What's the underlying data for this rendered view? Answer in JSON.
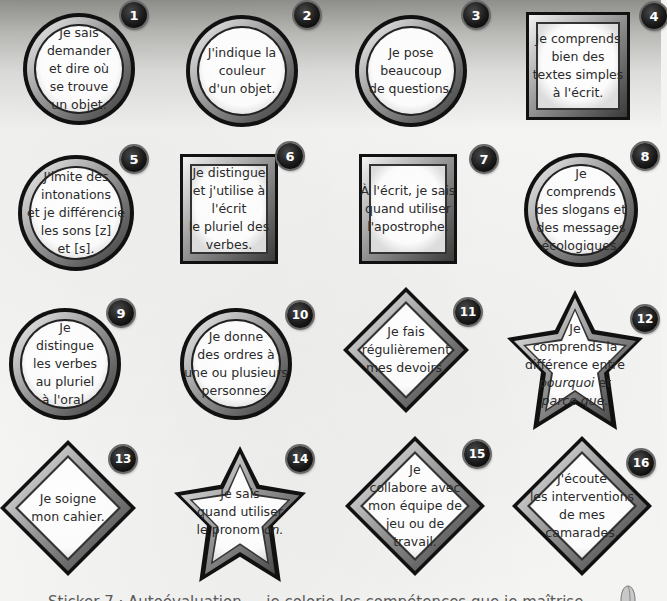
{
  "page": {
    "background": {
      "top_gradient": "#8e8e8b",
      "base": "#f4f4f3"
    },
    "colors": {
      "frame_dark": "#1a1a1a",
      "frame_mid": "#8a8a8a",
      "frame_light": "#ffffff",
      "text": "#2a2a2a",
      "badge": "#1a1a1a"
    }
  },
  "cards": [
    {
      "number": "1",
      "shape": "circle",
      "lines": [
        "Je sais",
        "demander",
        "et dire où",
        "se trouve",
        "un objet."
      ]
    },
    {
      "number": "2",
      "shape": "circle",
      "lines": [
        "J'indique la",
        "couleur",
        "d'un objet."
      ]
    },
    {
      "number": "3",
      "shape": "circle",
      "lines": [
        "Je pose",
        "beaucoup",
        "de questions."
      ]
    },
    {
      "number": "4",
      "shape": "square",
      "lines": [
        "Je comprends",
        "bien des",
        "textes simples",
        "à l'écrit."
      ]
    },
    {
      "number": "5",
      "shape": "circle",
      "lines": [
        "J'imite des",
        "intonations",
        "et je différencie",
        "les sons [z]",
        "et [s]."
      ]
    },
    {
      "number": "6",
      "shape": "square",
      "lines": [
        "Je distingue",
        "et j'utilise à",
        "l'écrit",
        "le pluriel des",
        "verbes."
      ]
    },
    {
      "number": "7",
      "shape": "square",
      "lines": [
        "À l'écrit, je sais",
        "quand utiliser",
        "l'apostrophe."
      ]
    },
    {
      "number": "8",
      "shape": "circle",
      "lines": [
        "Je",
        "comprends",
        "des slogans et",
        "des messages",
        "écologiques."
      ]
    },
    {
      "number": "9",
      "shape": "circle",
      "lines": [
        "Je",
        "distingue",
        "les verbes",
        "au pluriel",
        "à l'oral."
      ]
    },
    {
      "number": "10",
      "shape": "circle",
      "lines": [
        "Je donne",
        "des ordres à",
        "une ou plusieurs",
        "personnes."
      ]
    },
    {
      "number": "11",
      "shape": "diamond",
      "lines": [
        "Je fais",
        "régulièrement",
        "mes devoirs."
      ]
    },
    {
      "number": "12",
      "shape": "star",
      "lines": [
        "Je",
        "comprends la",
        "différence entre"
      ],
      "italic_lines": [
        {
          "italic": "pourquoi",
          "rest": " et"
        },
        {
          "italic": "parce que.",
          "rest": ""
        }
      ]
    },
    {
      "number": "13",
      "shape": "diamond",
      "lines": [
        "Je soigne",
        "mon cahier."
      ]
    },
    {
      "number": "14",
      "shape": "star",
      "lines": [
        "Je sais",
        "quand utiliser"
      ],
      "italic_lines": [
        {
          "prefix": "le pronom ",
          "italic": "on."
        }
      ]
    },
    {
      "number": "15",
      "shape": "diamond",
      "lines": [
        "Je",
        "collabore avec",
        "mon équipe de",
        "jeu ou de",
        "travail."
      ]
    },
    {
      "number": "16",
      "shape": "diamond",
      "lines": [
        "J'écoute",
        "les interventions",
        "de mes",
        "camarades."
      ]
    }
  ],
  "caption": {
    "text": "Sticker 7 · Autoévaluation — je colorie les compétences que je maîtrise",
    "truncated": true
  },
  "icons": {
    "pencil": "pencil-icon"
  }
}
